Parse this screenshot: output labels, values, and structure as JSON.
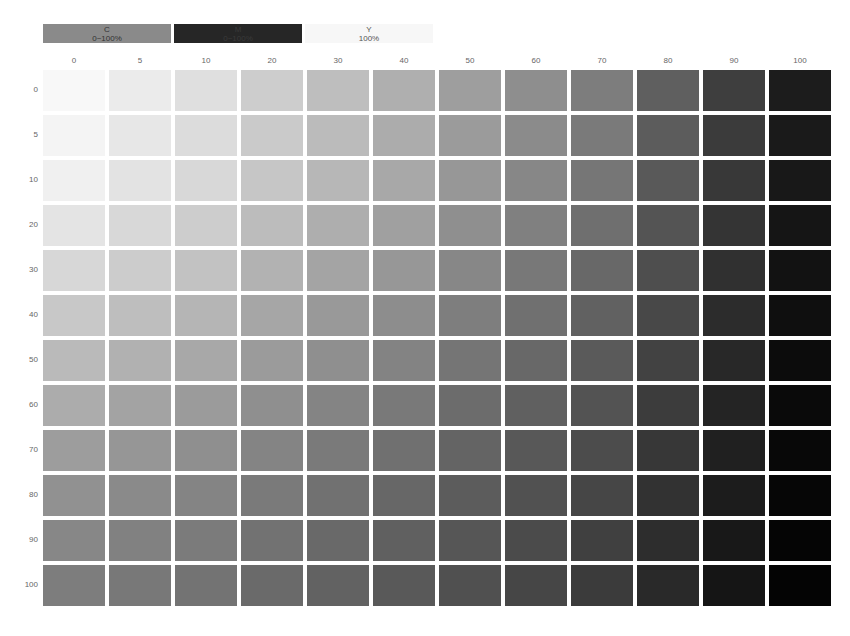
{
  "legend": [
    {
      "channel": "C",
      "range": "0~100%",
      "bg": "#8a8a8a",
      "fg": "#333333"
    },
    {
      "channel": "M",
      "range": "0~100%",
      "bg": "#262626",
      "fg": "#3a3a3a"
    },
    {
      "channel": "Y",
      "range": "100%",
      "bg": "#f7f7f7",
      "fg": "#555555"
    }
  ],
  "chart_data": {
    "type": "heatmap",
    "title": "",
    "legend_entries": [
      "C 0~100%",
      "M 0~100%",
      "Y 100%"
    ],
    "xlabel": "M (%)",
    "ylabel": "C (%)",
    "x": [
      0,
      5,
      10,
      20,
      30,
      40,
      50,
      60,
      70,
      80,
      90,
      100
    ],
    "y": [
      0,
      5,
      10,
      20,
      30,
      40,
      50,
      60,
      70,
      80,
      90,
      100
    ],
    "grid": false,
    "gray_levels": [
      [
        248,
        235,
        223,
        205,
        190,
        175,
        158,
        142,
        125,
        95,
        62,
        28
      ],
      [
        244,
        231,
        220,
        202,
        187,
        172,
        155,
        139,
        122,
        92,
        59,
        26
      ],
      [
        240,
        227,
        216,
        198,
        183,
        168,
        151,
        135,
        118,
        89,
        56,
        24
      ],
      [
        228,
        216,
        205,
        188,
        174,
        160,
        143,
        128,
        111,
        84,
        52,
        21
      ],
      [
        215,
        204,
        194,
        178,
        164,
        151,
        135,
        120,
        104,
        78,
        48,
        18
      ],
      [
        200,
        190,
        181,
        166,
        153,
        141,
        126,
        112,
        97,
        72,
        44,
        15
      ],
      [
        186,
        177,
        168,
        155,
        143,
        131,
        117,
        104,
        90,
        66,
        40,
        12
      ],
      [
        172,
        163,
        155,
        143,
        132,
        121,
        108,
        96,
        83,
        60,
        36,
        10
      ],
      [
        157,
        150,
        143,
        132,
        122,
        112,
        100,
        88,
        76,
        55,
        32,
        8
      ],
      [
        145,
        138,
        132,
        122,
        113,
        103,
        92,
        81,
        70,
        50,
        28,
        6
      ],
      [
        135,
        129,
        123,
        114,
        105,
        96,
        86,
        75,
        64,
        45,
        24,
        5
      ],
      [
        125,
        120,
        115,
        106,
        98,
        89,
        80,
        70,
        59,
        41,
        21,
        4
      ]
    ]
  },
  "layout": {
    "col_start": 0,
    "col_pitch": 66,
    "row_pitch": 45
  }
}
